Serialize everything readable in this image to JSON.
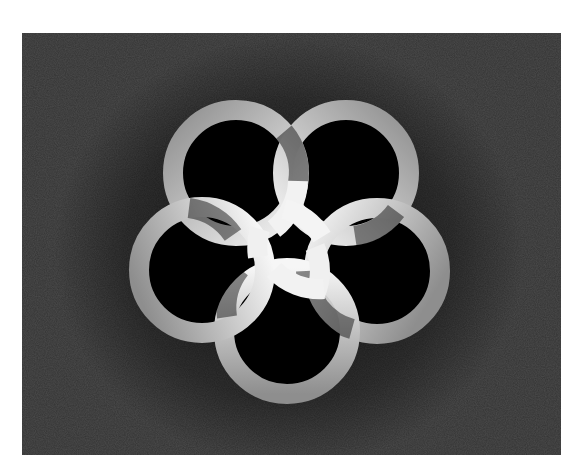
{
  "image": {
    "description": "Five interlocking silver rings arranged in a pinwheel on a dark textured background",
    "background_color": "#333333",
    "page_color": "#ffffff",
    "ring_light": "#f4f4f4",
    "ring_dark": "#8a8a8a",
    "ring_count": 5
  },
  "rings": [
    {
      "name": "ring-top-left",
      "cx": 214,
      "cy": 140
    },
    {
      "name": "ring-top-right",
      "cx": 324,
      "cy": 140
    },
    {
      "name": "ring-right",
      "cx": 355,
      "cy": 238
    },
    {
      "name": "ring-bottom",
      "cx": 265,
      "cy": 298
    },
    {
      "name": "ring-left",
      "cx": 180,
      "cy": 237
    }
  ],
  "geometry": {
    "outer_radius": 73,
    "inner_radius": 53,
    "center_x": 267,
    "center_y": 215
  }
}
